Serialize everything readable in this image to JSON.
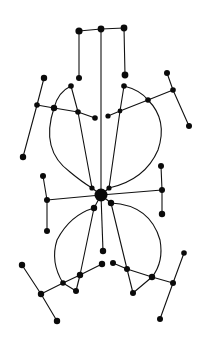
{
  "diagram": {
    "type": "node-link graph (hand-drawn, symmetric)",
    "colors": {
      "background": "#ffffff",
      "ink": "#111111"
    },
    "nodes": [
      {
        "id": "t1",
        "x": 79,
        "y": 31,
        "r": 3.6
      },
      {
        "id": "t2",
        "x": 101,
        "y": 29,
        "r": 3.4
      },
      {
        "id": "t3",
        "x": 124,
        "y": 28,
        "r": 3.4
      },
      {
        "id": "t4",
        "x": 79,
        "y": 78,
        "r": 3.0
      },
      {
        "id": "t5",
        "x": 125,
        "y": 75,
        "r": 3.4
      },
      {
        "id": "l1",
        "x": 44,
        "y": 78,
        "r": 3.2
      },
      {
        "id": "l2",
        "x": 71,
        "y": 86,
        "r": 2.8
      },
      {
        "id": "l3",
        "x": 37,
        "y": 105,
        "r": 2.8
      },
      {
        "id": "l4",
        "x": 54,
        "y": 108,
        "r": 3.2
      },
      {
        "id": "l5",
        "x": 78,
        "y": 112,
        "r": 2.8
      },
      {
        "id": "l6",
        "x": 95,
        "y": 118,
        "r": 2.8
      },
      {
        "id": "l7",
        "x": 23,
        "y": 157,
        "r": 3.2
      },
      {
        "id": "r1",
        "x": 167,
        "y": 73,
        "r": 3.0
      },
      {
        "id": "r2",
        "x": 124,
        "y": 86,
        "r": 2.8
      },
      {
        "id": "r3",
        "x": 173,
        "y": 90,
        "r": 2.8
      },
      {
        "id": "r4",
        "x": 148,
        "y": 100,
        "r": 2.8
      },
      {
        "id": "r5",
        "x": 120,
        "y": 111,
        "r": 2.4
      },
      {
        "id": "r6",
        "x": 108,
        "y": 116,
        "r": 2.6
      },
      {
        "id": "r7",
        "x": 189,
        "y": 126,
        "r": 3.0
      },
      {
        "id": "c",
        "x": 101,
        "y": 195,
        "r": 6.5
      },
      {
        "id": "c1",
        "x": 92,
        "y": 188,
        "r": 2.6
      },
      {
        "id": "c2",
        "x": 109,
        "y": 188,
        "r": 2.6
      },
      {
        "id": "c3",
        "x": 94,
        "y": 208,
        "r": 3.2
      },
      {
        "id": "c4",
        "x": 111,
        "y": 203,
        "r": 3.2
      },
      {
        "id": "ml1",
        "x": 43,
        "y": 176,
        "r": 3.0
      },
      {
        "id": "ml2",
        "x": 47,
        "y": 200,
        "r": 3.0
      },
      {
        "id": "ml3",
        "x": 47,
        "y": 231,
        "r": 3.0
      },
      {
        "id": "mr1",
        "x": 161,
        "y": 166,
        "r": 3.0
      },
      {
        "id": "mr2",
        "x": 162,
        "y": 190,
        "r": 3.0
      },
      {
        "id": "mr3",
        "x": 162,
        "y": 214,
        "r": 3.2
      },
      {
        "id": "b1",
        "x": 103,
        "y": 251,
        "r": 3.2
      },
      {
        "id": "b2",
        "x": 102,
        "y": 264,
        "r": 3.2
      },
      {
        "id": "b3",
        "x": 113,
        "y": 263,
        "r": 3.0
      },
      {
        "id": "bl1",
        "x": 22,
        "y": 265,
        "r": 3.2
      },
      {
        "id": "bl2",
        "x": 80,
        "y": 275,
        "r": 3.2
      },
      {
        "id": "bl3",
        "x": 63,
        "y": 283,
        "r": 2.8
      },
      {
        "id": "bl4",
        "x": 76,
        "y": 291,
        "r": 3.0
      },
      {
        "id": "bl5",
        "x": 41,
        "y": 294,
        "r": 3.2
      },
      {
        "id": "bl6",
        "x": 57,
        "y": 321,
        "r": 3.2
      },
      {
        "id": "br1",
        "x": 184,
        "y": 253,
        "r": 2.8
      },
      {
        "id": "br2",
        "x": 127,
        "y": 269,
        "r": 3.0
      },
      {
        "id": "br3",
        "x": 152,
        "y": 277,
        "r": 3.2
      },
      {
        "id": "br4",
        "x": 173,
        "y": 283,
        "r": 3.0
      },
      {
        "id": "br5",
        "x": 133,
        "y": 293,
        "r": 3.0
      },
      {
        "id": "br6",
        "x": 160,
        "y": 319,
        "r": 3.0
      }
    ],
    "edges": [
      [
        "t1",
        "t2"
      ],
      [
        "t2",
        "t3"
      ],
      [
        "t1",
        "t4"
      ],
      [
        "t3",
        "t5"
      ],
      [
        "t2",
        "c"
      ],
      [
        "l1",
        "l3"
      ],
      [
        "l3",
        "l7"
      ],
      [
        "l3",
        "l4"
      ],
      [
        "l4",
        "l5"
      ],
      [
        "l5",
        "l6"
      ],
      [
        "l2",
        "l5"
      ],
      [
        "l5",
        "c1"
      ],
      [
        "r1",
        "r3"
      ],
      [
        "r3",
        "r7"
      ],
      [
        "r3",
        "r4"
      ],
      [
        "r4",
        "r5"
      ],
      [
        "r5",
        "r6"
      ],
      [
        "r2",
        "r5"
      ],
      [
        "r5",
        "c2"
      ],
      [
        "c",
        "c1"
      ],
      [
        "c",
        "c2"
      ],
      [
        "c",
        "c3"
      ],
      [
        "c",
        "c4"
      ],
      [
        "c",
        "ml2"
      ],
      [
        "c",
        "mr2"
      ],
      [
        "c",
        "b1"
      ],
      [
        "ml1",
        "ml2"
      ],
      [
        "ml2",
        "ml3"
      ],
      [
        "mr1",
        "mr2"
      ],
      [
        "mr2",
        "mr3"
      ],
      [
        "b2",
        "bl2"
      ],
      [
        "bl2",
        "bl3"
      ],
      [
        "bl3",
        "bl5"
      ],
      [
        "bl1",
        "bl5"
      ],
      [
        "bl5",
        "bl6"
      ],
      [
        "bl2",
        "bl4"
      ],
      [
        "bl3",
        "bl4"
      ],
      [
        "c3",
        "bl2"
      ],
      [
        "b3",
        "br2"
      ],
      [
        "br2",
        "br3"
      ],
      [
        "br3",
        "br4"
      ],
      [
        "br1",
        "br4"
      ],
      [
        "br4",
        "br6"
      ],
      [
        "br2",
        "br5"
      ],
      [
        "br3",
        "br5"
      ],
      [
        "c4",
        "br2"
      ]
    ],
    "curves": [
      {
        "from": "l2",
        "to": "l4",
        "d": "M71 86 Q58 92 54 108"
      },
      {
        "from": "l4",
        "to": "c1",
        "d": "M54 108 Q40 150 70 172 Q82 182 92 188"
      },
      {
        "from": "r2",
        "to": "r4",
        "d": "M124 86 Q140 90 148 100"
      },
      {
        "from": "r4",
        "to": "c2",
        "d": "M148 100 Q168 120 158 150 Q145 180 109 188"
      },
      {
        "from": "c3",
        "to": "bl3",
        "d": "M94 208 Q70 215 57 240 Q50 262 63 283"
      },
      {
        "from": "c4",
        "to": "br3",
        "d": "M111 203 Q150 205 160 240 Q164 262 152 277"
      }
    ]
  }
}
